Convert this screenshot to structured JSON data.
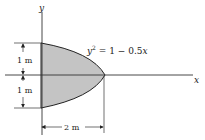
{
  "diagram": {
    "axes": {
      "x_label": "x",
      "y_label": "y"
    },
    "equation": {
      "lhs": "y",
      "exp": "2",
      "rhs": " = 1 − 0.5",
      "var": "x"
    },
    "dimensions": {
      "upper_height": "1 m",
      "lower_height": "1 m",
      "width": "2 m"
    },
    "colors": {
      "fill": "#c4c4c4",
      "stroke": "#222222"
    }
  }
}
